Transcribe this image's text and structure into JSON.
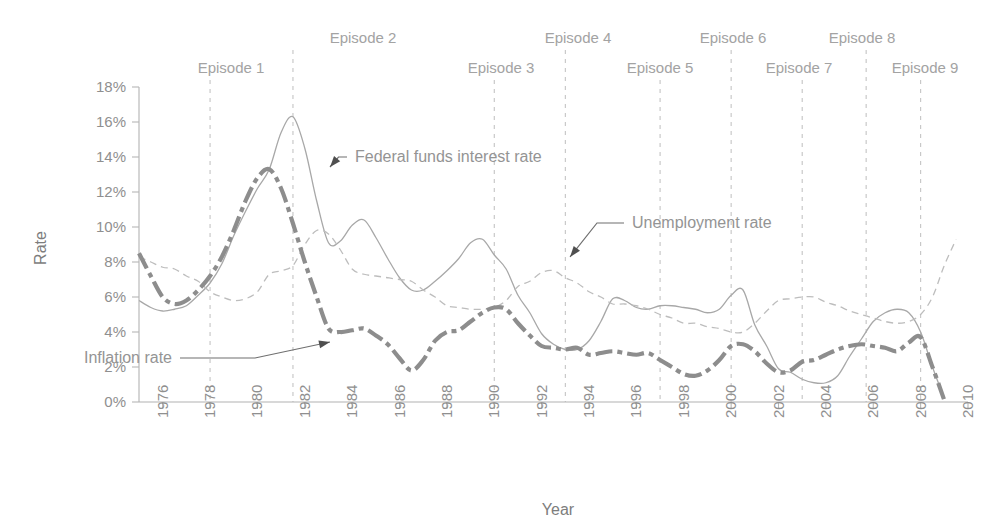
{
  "chart_data": {
    "type": "line",
    "title": "",
    "xlabel": "Year",
    "ylabel": "Rate",
    "xlim": [
      1975,
      2010
    ],
    "ylim": [
      0,
      18
    ],
    "grid": false,
    "legend_position": "inline-annotations",
    "y_tick_labels": [
      "0%",
      "2%",
      "4%",
      "6%",
      "8%",
      "10%",
      "12%",
      "14%",
      "16%",
      "18%"
    ],
    "y_tick_values": [
      0,
      2,
      4,
      6,
      8,
      10,
      12,
      14,
      16,
      18
    ],
    "x_tick_labels": [
      "1976",
      "1978",
      "1980",
      "1982",
      "1984",
      "1986",
      "1988",
      "1990",
      "1992",
      "1994",
      "1996",
      "1998",
      "2000",
      "2002",
      "2004",
      "2006",
      "2008",
      "2010"
    ],
    "x_tick_values": [
      1976,
      1978,
      1980,
      1982,
      1984,
      1986,
      1988,
      1990,
      1992,
      1994,
      1996,
      1998,
      2000,
      2002,
      2004,
      2006,
      2008,
      2010
    ],
    "series": [
      {
        "name": "Federal funds interest rate",
        "style": "solid-thin",
        "color": "#a8a8a8",
        "x": [
          1975.0,
          1975.5,
          1976.0,
          1976.5,
          1977.0,
          1977.5,
          1978.0,
          1978.5,
          1979.0,
          1979.5,
          1980.0,
          1980.5,
          1981.0,
          1981.5,
          1982.0,
          1982.5,
          1983.0,
          1983.5,
          1984.0,
          1984.5,
          1985.0,
          1985.5,
          1986.0,
          1986.5,
          1987.0,
          1987.5,
          1988.0,
          1988.5,
          1989.0,
          1989.5,
          1990.0,
          1990.5,
          1991.0,
          1991.5,
          1992.0,
          1992.5,
          1993.0,
          1993.5,
          1994.0,
          1994.5,
          1995.0,
          1995.5,
          1996.0,
          1996.5,
          1997.0,
          1997.5,
          1998.0,
          1998.5,
          1999.0,
          1999.5,
          2000.0,
          2000.5,
          2001.0,
          2001.5,
          2002.0,
          2002.5,
          2003.0,
          2003.5,
          2004.0,
          2004.5,
          2005.0,
          2005.5,
          2006.0,
          2006.5,
          2007.0,
          2007.5,
          2008.0,
          2008.5,
          2009.0
        ],
        "y": [
          5.8,
          5.4,
          5.2,
          5.3,
          5.5,
          6.1,
          6.8,
          7.9,
          9.5,
          10.9,
          12.2,
          13.3,
          15.4,
          16.3,
          14.5,
          11.5,
          9.1,
          9.2,
          10.1,
          10.4,
          9.4,
          8.2,
          7.1,
          6.4,
          6.4,
          6.9,
          7.5,
          8.2,
          9.1,
          9.3,
          8.4,
          7.6,
          6.1,
          5.1,
          3.9,
          3.3,
          3.0,
          3.0,
          3.5,
          4.6,
          5.9,
          5.8,
          5.4,
          5.3,
          5.5,
          5.5,
          5.4,
          5.3,
          5.1,
          5.3,
          6.1,
          6.4,
          4.4,
          3.2,
          1.9,
          1.7,
          1.3,
          1.1,
          1.1,
          1.5,
          2.6,
          3.6,
          4.6,
          5.1,
          5.3,
          5.1,
          4.0,
          2.0,
          0.2
        ]
      },
      {
        "name": "Unemployment rate",
        "style": "dashed-fine",
        "color": "#bdbdbd",
        "x": [
          1975.0,
          1975.5,
          1976.0,
          1976.5,
          1977.0,
          1977.5,
          1978.0,
          1978.5,
          1979.0,
          1979.5,
          1980.0,
          1980.5,
          1981.0,
          1981.5,
          1982.0,
          1982.5,
          1983.0,
          1983.5,
          1984.0,
          1984.5,
          1985.0,
          1985.5,
          1986.0,
          1986.5,
          1987.0,
          1987.5,
          1988.0,
          1988.5,
          1989.0,
          1989.5,
          1990.0,
          1990.5,
          1991.0,
          1991.5,
          1992.0,
          1992.5,
          1993.0,
          1993.5,
          1994.0,
          1994.5,
          1995.0,
          1995.5,
          1996.0,
          1996.5,
          1997.0,
          1997.5,
          1998.0,
          1998.5,
          1999.0,
          1999.5,
          2000.0,
          2000.5,
          2001.0,
          2001.5,
          2002.0,
          2002.5,
          2003.0,
          2003.5,
          2004.0,
          2004.5,
          2005.0,
          2005.5,
          2006.0,
          2006.5,
          2007.0,
          2007.5,
          2008.0,
          2008.5,
          2009.0,
          2009.5
        ],
        "y": [
          8.3,
          8.0,
          7.7,
          7.6,
          7.2,
          6.9,
          6.3,
          6.0,
          5.8,
          5.9,
          6.3,
          7.3,
          7.5,
          7.8,
          9.0,
          9.8,
          9.6,
          8.7,
          7.6,
          7.3,
          7.2,
          7.1,
          7.0,
          6.9,
          6.4,
          6.0,
          5.5,
          5.4,
          5.3,
          5.3,
          5.4,
          5.8,
          6.6,
          6.9,
          7.4,
          7.5,
          7.1,
          6.8,
          6.3,
          6.0,
          5.6,
          5.6,
          5.5,
          5.3,
          5.0,
          4.8,
          4.5,
          4.5,
          4.3,
          4.2,
          4.0,
          4.0,
          4.5,
          5.2,
          5.8,
          5.9,
          6.0,
          6.0,
          5.7,
          5.5,
          5.2,
          5.0,
          4.8,
          4.6,
          4.5,
          4.6,
          5.0,
          6.0,
          7.8,
          9.3
        ]
      },
      {
        "name": "Inflation rate",
        "style": "dash-dot-thick",
        "color": "#8d8d8d",
        "x": [
          1975.0,
          1975.5,
          1976.0,
          1976.5,
          1977.0,
          1977.5,
          1978.0,
          1978.5,
          1979.0,
          1979.5,
          1980.0,
          1980.5,
          1981.0,
          1981.5,
          1982.0,
          1982.5,
          1983.0,
          1983.5,
          1984.0,
          1984.5,
          1985.0,
          1985.5,
          1986.0,
          1986.5,
          1987.0,
          1987.5,
          1988.0,
          1988.5,
          1989.0,
          1989.5,
          1990.0,
          1990.5,
          1991.0,
          1991.5,
          1992.0,
          1992.5,
          1993.0,
          1993.5,
          1994.0,
          1994.5,
          1995.0,
          1995.5,
          1996.0,
          1996.5,
          1997.0,
          1997.5,
          1998.0,
          1998.5,
          1999.0,
          1999.5,
          2000.0,
          2000.5,
          2001.0,
          2001.5,
          2002.0,
          2002.5,
          2003.0,
          2003.5,
          2004.0,
          2004.5,
          2005.0,
          2005.5,
          2006.0,
          2006.5,
          2007.0,
          2007.5,
          2008.0,
          2008.5,
          2009.0
        ],
        "y": [
          8.5,
          7.2,
          6.0,
          5.6,
          5.8,
          6.4,
          7.2,
          8.3,
          9.8,
          11.5,
          12.8,
          13.3,
          12.2,
          10.2,
          8.0,
          6.0,
          4.2,
          4.0,
          4.1,
          4.2,
          3.8,
          3.3,
          2.5,
          1.8,
          2.4,
          3.5,
          4.0,
          4.1,
          4.6,
          5.1,
          5.4,
          5.3,
          4.5,
          3.8,
          3.2,
          3.1,
          3.0,
          3.1,
          2.7,
          2.8,
          2.9,
          2.8,
          2.7,
          2.8,
          2.4,
          2.0,
          1.6,
          1.5,
          1.8,
          2.4,
          3.2,
          3.3,
          2.9,
          2.2,
          1.7,
          1.8,
          2.3,
          2.4,
          2.7,
          3.0,
          3.2,
          3.3,
          3.2,
          3.1,
          2.9,
          3.4,
          3.7,
          2.0,
          0.1
        ]
      }
    ],
    "annotations": [
      {
        "text": "Federal funds interest rate",
        "series": "Federal funds interest rate",
        "label_x": 355,
        "label_y": 157
      },
      {
        "text": "Unemployment rate",
        "series": "Unemployment rate",
        "label_x": 632,
        "label_y": 223
      },
      {
        "text": "Inflation rate",
        "series": "Inflation rate",
        "label_x": 172,
        "label_y": 358
      }
    ],
    "episode_markers": [
      {
        "label": "Episode 1",
        "year": 1978.0,
        "label_level": "low",
        "label_x": 231,
        "label_y": 73
      },
      {
        "label": "Episode 2",
        "year": 1981.5,
        "label_level": "high",
        "label_x": 363,
        "label_y": 43
      },
      {
        "label": "Episode 3",
        "year": 1990.0,
        "label_level": "low",
        "label_x": 501,
        "label_y": 73
      },
      {
        "label": "Episode 4",
        "year": 1993.0,
        "label_level": "high",
        "label_x": 578,
        "label_y": 43
      },
      {
        "label": "Episode 5",
        "year": 1997.0,
        "label_level": "low",
        "label_x": 660,
        "label_y": 73
      },
      {
        "label": "Episode 6",
        "year": 2000.0,
        "label_level": "high",
        "label_x": 733,
        "label_y": 43
      },
      {
        "label": "Episode 7",
        "year": 2003.0,
        "label_level": "low",
        "label_x": 799,
        "label_y": 73
      },
      {
        "label": "Episode 8",
        "year": 2005.7,
        "label_level": "high",
        "label_x": 862,
        "label_y": 43
      },
      {
        "label": "Episode 9",
        "year": 2008.0,
        "label_level": "low",
        "label_x": 925,
        "label_y": 73
      }
    ]
  }
}
